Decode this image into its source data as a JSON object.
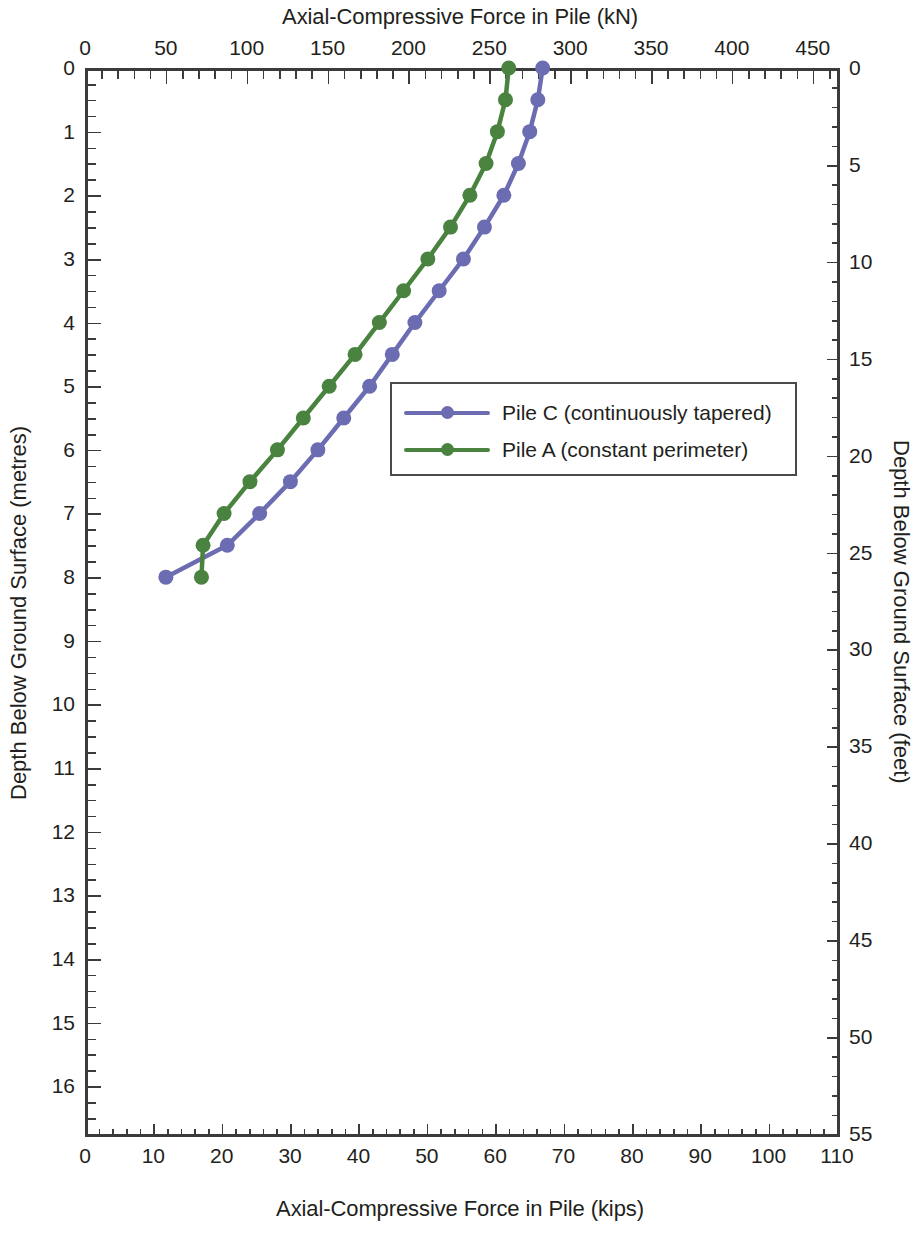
{
  "chart_data": {
    "type": "line",
    "title": "Axial-Compressive Force in Pile (kN)",
    "subtitle": "",
    "xlabel": "Axial-Compressive Force in Pile (kN)",
    "xlabel_secondary": "Axial-Compressive Force in Pile (kips)",
    "ylabel": "Depth Below Ground Surface (metres)",
    "ylabel_secondary": "Depth Below Ground Surface (feet)",
    "xlim": [
      0,
      465
    ],
    "ylim": [
      0,
      16.75
    ],
    "xlim_secondary": [
      0,
      110
    ],
    "ylim_secondary": [
      0,
      55
    ],
    "grid": false,
    "legend_position": "center-right",
    "top_axis_ticks": [
      0,
      50,
      100,
      150,
      200,
      250,
      300,
      350,
      400,
      450
    ],
    "top_axis_minor_step": 10,
    "bottom_axis_ticks": [
      0,
      10,
      20,
      30,
      40,
      50,
      60,
      70,
      80,
      90,
      100,
      110
    ],
    "bottom_axis_minor_step": 2,
    "left_axis_ticks": [
      0,
      1,
      2,
      3,
      4,
      5,
      6,
      7,
      8,
      9,
      10,
      11,
      12,
      13,
      14,
      15,
      16
    ],
    "left_axis_minor_step": 0.25,
    "right_axis_ticks": [
      0,
      5,
      10,
      15,
      20,
      25,
      30,
      35,
      40,
      45,
      50,
      55
    ],
    "right_axis_minor_step": 1,
    "series": [
      {
        "name": "Pile C (continuously tapered)",
        "color": "#6c6cb2",
        "marker": "circle",
        "x_unit": "kN",
        "y_unit": "m",
        "x": [
          283,
          280,
          275,
          268,
          258,
          246,
          233,
          219,
          204,
          190,
          176,
          160,
          144,
          127,
          110,
          93,
          77,
          50
        ],
        "y": [
          0,
          0.5,
          1,
          1.5,
          2,
          2.5,
          3,
          3.5,
          4,
          4.5,
          5,
          5.5,
          6,
          6.5,
          7,
          7.5,
          7.0,
          8
        ]
      },
      {
        "name": "Pile A (constant perimeter)",
        "color": "#4a8240",
        "marker": "circle",
        "x_unit": "kN",
        "y_unit": "m",
        "x": [
          262,
          260,
          255,
          248,
          238,
          226,
          212,
          197,
          182,
          167,
          152,
          136,
          120,
          104,
          88,
          73,
          61,
          58
        ],
        "y": [
          0,
          0.5,
          1,
          1.5,
          2,
          2.5,
          3,
          3.5,
          4,
          4.5,
          5,
          5.5,
          6,
          6.5,
          7,
          7.5,
          7.0,
          8
        ]
      }
    ],
    "series_points": {
      "pile_c": [
        {
          "force_kN": 283,
          "depth_m": 0.0
        },
        {
          "force_kN": 280,
          "depth_m": 0.5
        },
        {
          "force_kN": 275,
          "depth_m": 1.0
        },
        {
          "force_kN": 268,
          "depth_m": 1.5
        },
        {
          "force_kN": 259,
          "depth_m": 2.0
        },
        {
          "force_kN": 247,
          "depth_m": 2.5
        },
        {
          "force_kN": 234,
          "depth_m": 3.0
        },
        {
          "force_kN": 219,
          "depth_m": 3.5
        },
        {
          "force_kN": 204,
          "depth_m": 4.0
        },
        {
          "force_kN": 190,
          "depth_m": 4.5
        },
        {
          "force_kN": 176,
          "depth_m": 5.0
        },
        {
          "force_kN": 160,
          "depth_m": 5.5
        },
        {
          "force_kN": 144,
          "depth_m": 6.0
        },
        {
          "force_kN": 127,
          "depth_m": 6.5
        },
        {
          "force_kN": 108,
          "depth_m": 7.0
        },
        {
          "force_kN": 88,
          "depth_m": 7.5
        },
        {
          "force_kN": 50,
          "depth_m": 8.0
        }
      ],
      "pile_a": [
        {
          "force_kN": 262,
          "depth_m": 0.0
        },
        {
          "force_kN": 260,
          "depth_m": 0.5
        },
        {
          "force_kN": 255,
          "depth_m": 1.0
        },
        {
          "force_kN": 248,
          "depth_m": 1.5
        },
        {
          "force_kN": 238,
          "depth_m": 2.0
        },
        {
          "force_kN": 226,
          "depth_m": 2.5
        },
        {
          "force_kN": 212,
          "depth_m": 3.0
        },
        {
          "force_kN": 197,
          "depth_m": 3.5
        },
        {
          "force_kN": 182,
          "depth_m": 4.0
        },
        {
          "force_kN": 167,
          "depth_m": 4.5
        },
        {
          "force_kN": 151,
          "depth_m": 5.0
        },
        {
          "force_kN": 135,
          "depth_m": 5.5
        },
        {
          "force_kN": 119,
          "depth_m": 6.0
        },
        {
          "force_kN": 102,
          "depth_m": 6.5
        },
        {
          "force_kN": 86,
          "depth_m": 7.0
        },
        {
          "force_kN": 73,
          "depth_m": 7.5
        },
        {
          "force_kN": 72,
          "depth_m": 8.0
        }
      ]
    }
  },
  "legend": {
    "items": [
      {
        "label": "Pile C (continuously tapered)",
        "color": "#6c6cb2"
      },
      {
        "label": "Pile A (constant perimeter)",
        "color": "#4a8240"
      }
    ]
  },
  "axes": {
    "top_title": "Axial-Compressive Force in Pile (kN)",
    "bottom_title": "Axial-Compressive Force in Pile (kips)",
    "left_title": "Depth Below Ground Surface (metres)",
    "right_title": "Depth Below Ground Surface (feet)"
  }
}
